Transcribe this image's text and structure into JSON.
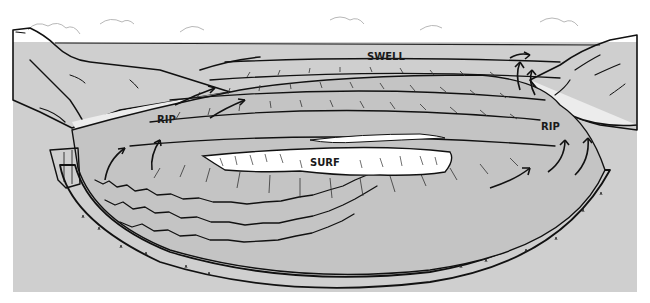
{
  "diagram": {
    "colors": {
      "background": "#ffffff",
      "panel": "#cfcfcf",
      "water": "#c8c8c8",
      "surf_foam": "#ffffff",
      "sand": "#ebebeb",
      "ink": "#111111"
    },
    "labels": {
      "swell": "SWELL",
      "surf": "SURF",
      "rip_left": "RIP",
      "rip_right": "RIP"
    }
  }
}
